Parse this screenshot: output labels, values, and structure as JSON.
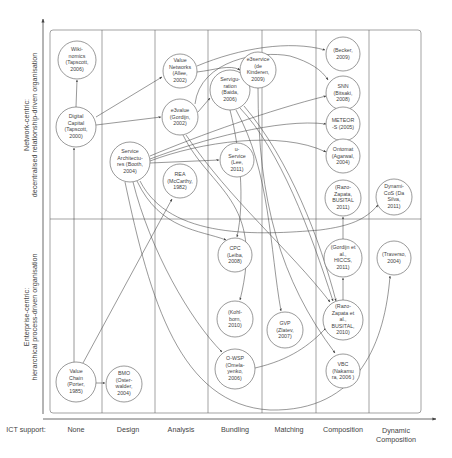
{
  "diagram": {
    "y_axis": {
      "top_label_line1": "Network-centric:",
      "top_label_line2": "decentralised relationship-driven organisation",
      "bottom_label_line1": "Enterprise-centric:",
      "bottom_label_line2": "hierarchical process-driven organisation"
    },
    "x_axis": {
      "title": "ICT support:",
      "columns": [
        {
          "label": "None"
        },
        {
          "label": "Design"
        },
        {
          "label": "Analysis"
        },
        {
          "label": "Bundling"
        },
        {
          "label": "Matching"
        },
        {
          "label": "Composition"
        },
        {
          "label": "Dynamic",
          "label2": "Composition"
        }
      ]
    },
    "nodes": [
      {
        "id": "wikinomics",
        "lines": [
          "Wiki-",
          "nomics",
          "(Tapscott,",
          "2006)"
        ]
      },
      {
        "id": "digital-capital",
        "lines": [
          "Digital",
          "Capital",
          "(Tapscott,",
          "2000)"
        ]
      },
      {
        "id": "value-networks",
        "lines": [
          "Value",
          "Networks",
          "(Allee,",
          "2002)"
        ]
      },
      {
        "id": "e3value",
        "lines": [
          "e3value",
          "(Gordijn,",
          "2002)"
        ]
      },
      {
        "id": "service-architectures",
        "lines": [
          "Service",
          "Architectu-",
          "res (Booth,",
          "2004)"
        ]
      },
      {
        "id": "rea",
        "lines": [
          "REA",
          "(McCarthy,",
          "1982)"
        ]
      },
      {
        "id": "serviguration",
        "lines": [
          "Servigu-",
          "ration",
          "(Baida,",
          "2006)"
        ]
      },
      {
        "id": "e3service",
        "lines": [
          "e3service",
          "(de",
          "Kinderen,",
          "2009)"
        ]
      },
      {
        "id": "u-service",
        "lines": [
          "u-",
          "Service",
          "(Lee,",
          "2011)"
        ]
      },
      {
        "id": "becker",
        "lines": [
          "(Becker,",
          "2009)"
        ]
      },
      {
        "id": "snn",
        "lines": [
          "SNN",
          "(Bitsaki,",
          "2008)"
        ]
      },
      {
        "id": "meteor-s",
        "lines": [
          "METEOR",
          "-S (2005)"
        ]
      },
      {
        "id": "ontomat",
        "lines": [
          "Ontomat",
          "(Agarwal,",
          "2004)"
        ]
      },
      {
        "id": "razo-zapata-2011",
        "lines": [
          "(Razo-",
          "Zapata,",
          "BUSITAL",
          "2011)"
        ]
      },
      {
        "id": "dynamicos",
        "lines": [
          "Dynami-",
          "CoS (Da",
          "Silva,",
          "2011)"
        ]
      },
      {
        "id": "cpc",
        "lines": [
          "CPC",
          "(Leiba,",
          "2008)"
        ]
      },
      {
        "id": "kohlborn",
        "lines": [
          "(Kohl-",
          "born,",
          "2010)"
        ]
      },
      {
        "id": "gvp",
        "lines": [
          "GVP",
          "(Zlatev,",
          "2007)"
        ]
      },
      {
        "id": "o-wsp",
        "lines": [
          "O-WSP",
          "(Omela-",
          "yenko,",
          "2006)"
        ]
      },
      {
        "id": "gordijn-hiccs",
        "lines": [
          "(Gordijn et",
          "al.,",
          "HICCS,",
          "2011)"
        ]
      },
      {
        "id": "razo-zapata-2010",
        "lines": [
          "(Razo-",
          "Zapata et",
          "al.,",
          "BUSITAL,",
          "2010)"
        ]
      },
      {
        "id": "vbc",
        "lines": [
          "VBC",
          "(Nakamu",
          "ra, 2006 )"
        ]
      },
      {
        "id": "traverso",
        "lines": [
          "(Traverso,",
          "2004)"
        ]
      },
      {
        "id": "value-chain",
        "lines": [
          "Value",
          "Chain",
          "(Porter,",
          "1985)"
        ]
      },
      {
        "id": "bmo",
        "lines": [
          "BMO",
          "(Oster-",
          "walder,",
          "2004)"
        ]
      }
    ],
    "colors": {
      "line": "#444444",
      "frame": "#666666",
      "text": "#444444",
      "background": "#ffffff"
    }
  }
}
